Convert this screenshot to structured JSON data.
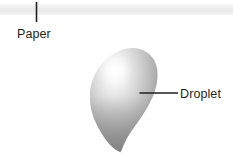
{
  "figure": {
    "background_color": "#ffffff",
    "width": 233,
    "height": 158
  },
  "paper": {
    "label": "Paper",
    "band_color_top": "#f4f4f4",
    "band_color_mid": "#eaeaea",
    "band_color_bottom": "#f7f7f7",
    "leader_color": "#231f20"
  },
  "droplet": {
    "label": "Droplet",
    "highlight_color": "#fdfdfd",
    "body_light_color": "#e3e3e3",
    "body_mid_color": "#c3c3c3",
    "body_dark_color": "#878787",
    "leader_color": "#231f20"
  }
}
